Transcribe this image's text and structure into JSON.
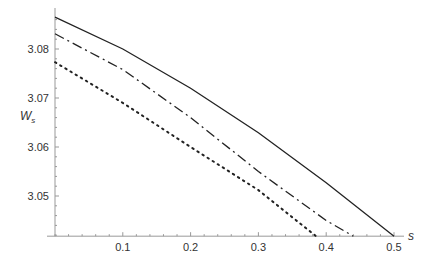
{
  "chart_data": {
    "type": "line",
    "title": "",
    "xlabel": "s",
    "ylabel": "W_s",
    "xlim": [
      0,
      0.5
    ],
    "ylim": [
      3.0418,
      3.0875
    ],
    "x_ticks": [
      "0.1",
      "0.2",
      "0.3",
      "0.4",
      "0.5"
    ],
    "y_ticks": [
      "3.05",
      "3.06",
      "3.07",
      "3.08"
    ],
    "grid": false,
    "legend": null,
    "series": [
      {
        "name": "solid",
        "style": "solid",
        "x": [
          0,
          0.1,
          0.2,
          0.3,
          0.4,
          0.5
        ],
        "y": [
          3.0865,
          3.08,
          3.072,
          3.0629,
          3.0527,
          3.0418
        ]
      },
      {
        "name": "dash-dot",
        "style": "dashdot",
        "x": [
          0,
          0.1,
          0.2,
          0.3,
          0.4,
          0.44
        ],
        "y": [
          3.0831,
          3.0758,
          3.066,
          3.055,
          3.045,
          3.0418
        ]
      },
      {
        "name": "dotted",
        "style": "dotted",
        "x": [
          0,
          0.1,
          0.2,
          0.3,
          0.385
        ],
        "y": [
          3.0773,
          3.069,
          3.06,
          3.0512,
          3.0418
        ]
      }
    ]
  }
}
